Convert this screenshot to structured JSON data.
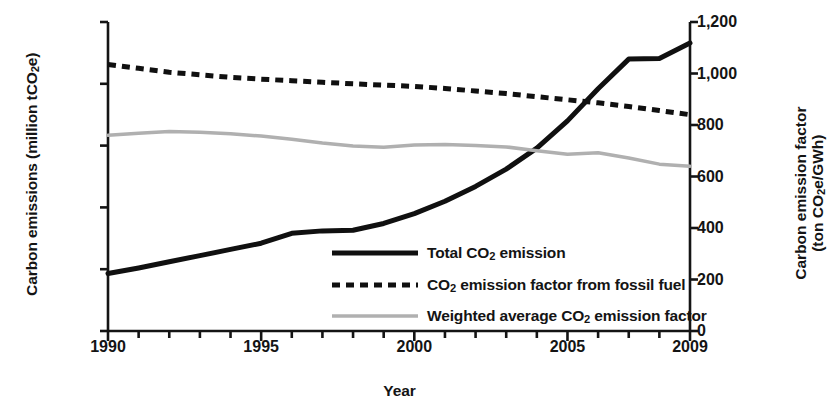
{
  "chart_data": {
    "type": "line",
    "title": "",
    "xlabel": "Year",
    "ylabel_left": "Carbon emissions (million tCO2e)",
    "ylabel_right_line1": "Carbon emission factor",
    "ylabel_right_line2": "(ton CO2e/GWh)",
    "x": [
      1990,
      1991,
      1992,
      1993,
      1994,
      1995,
      1996,
      1997,
      1998,
      1999,
      2000,
      2001,
      2002,
      2003,
      2004,
      2005,
      2006,
      2007,
      2008,
      2009
    ],
    "xlim": [
      1990,
      2009
    ],
    "xtick_labels": [
      "1990",
      "1995",
      "2000",
      "2005",
      "2009"
    ],
    "xtick_values": [
      1990,
      1995,
      2000,
      2005,
      2009
    ],
    "xtick_minor_step": 1,
    "ylim_left": [
      0,
      2500
    ],
    "ytick_labels_left": [
      "0",
      "500",
      "1,000",
      "1,500",
      "2,000",
      "2,500"
    ],
    "ytick_values_left": [
      0,
      500,
      1000,
      1500,
      2000,
      2500
    ],
    "ylim_right": [
      0,
      1200
    ],
    "ytick_labels_right": [
      "0",
      "200",
      "400",
      "600",
      "800",
      "1,000",
      "1,200"
    ],
    "ytick_values_right": [
      0,
      200,
      400,
      600,
      800,
      1000,
      1200
    ],
    "grid": false,
    "legend_position": "center-right-inside",
    "series": [
      {
        "name": "Total CO2 emission",
        "legend_label": "Total CO2 emission",
        "axis": "left",
        "style": "solid",
        "color": "#101010",
        "width": 5,
        "values": [
          465,
          510,
          560,
          610,
          660,
          710,
          790,
          810,
          815,
          870,
          950,
          1050,
          1170,
          1310,
          1480,
          1700,
          1960,
          2200,
          2205,
          2330
        ]
      },
      {
        "name": "CO2 emission factor from fossil fuel",
        "legend_label": "CO2 emission factor from fossil fuel",
        "axis": "right",
        "style": "dashed",
        "color": "#101010",
        "width": 5,
        "values": [
          1035,
          1020,
          1005,
          995,
          985,
          978,
          972,
          966,
          960,
          955,
          950,
          942,
          932,
          922,
          910,
          898,
          886,
          872,
          856,
          840
        ]
      },
      {
        "name": "Weighted average CO2 emission factor",
        "legend_label": "Weighted average CO2 emission factor",
        "axis": "right",
        "style": "solid",
        "color": "#b0b0b0",
        "width": 3.5,
        "values": [
          760,
          768,
          775,
          772,
          766,
          757,
          745,
          730,
          718,
          714,
          722,
          724,
          720,
          715,
          700,
          686,
          692,
          672,
          648,
          640
        ]
      }
    ]
  },
  "legend": {
    "items": [
      {
        "label_prefix": "Total CO",
        "label_sub": "2",
        "label_suffix": " emission",
        "style": "solid",
        "color": "#101010"
      },
      {
        "label_prefix": "CO",
        "label_sub": "2",
        "label_suffix": " emission factor from fossil fuel",
        "style": "dashed",
        "color": "#101010"
      },
      {
        "label_prefix": "Weighted average CO",
        "label_sub": "2",
        "label_suffix": " emission factor",
        "style": "solid-gray",
        "color": "#b0b0b0"
      }
    ]
  },
  "axis_titles": {
    "left_prefix": "Carbon emissions (million tCO",
    "left_sub": "2",
    "left_suffix": "e)",
    "right_line1": "Carbon emission factor",
    "right_line2_prefix": "(ton CO",
    "right_line2_sub": "2",
    "right_line2_suffix": "e/GWh)",
    "x": "Year"
  }
}
